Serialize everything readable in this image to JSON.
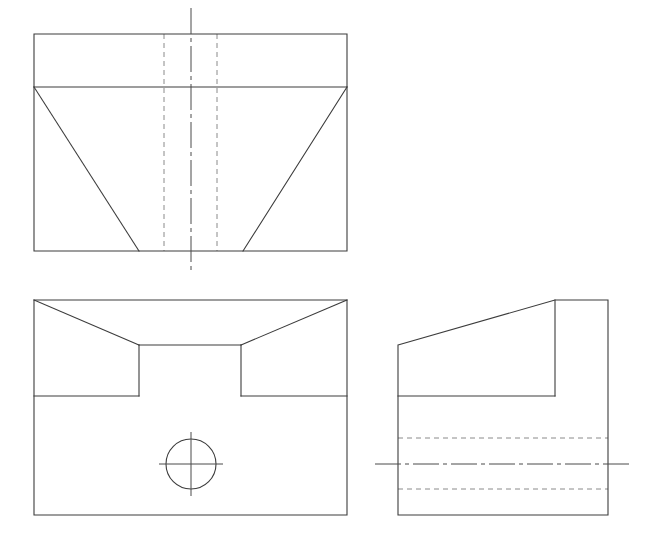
{
  "sheet": {
    "title": "Orthographic Projection - Three View Engineering Drawing",
    "width": 664,
    "height": 556,
    "background_color": "#ffffff",
    "projection": "third-angle",
    "line_styles": {
      "visible_edge_color": "#3c3c3c",
      "visible_edge_width": 1.1,
      "hidden_edge_color": "#8a8a8a",
      "hidden_edge_width": 1,
      "hidden_dash_pattern": "5 4",
      "center_line_color": "#4a4a4a",
      "center_line_width": 1,
      "center_dash_pattern": "26 4 4 4"
    }
  },
  "views": {
    "top": {
      "name": "Top View",
      "outline": "M 34 34 L 347 34 L 347 251 L 34 251 Z",
      "horizontal_divider": "M 34 87 L 347 87",
      "left_taper": "M 34 87 L 139 251",
      "right_taper": "M 347 87 L 243 251",
      "hidden_lines": [
        "M 164 34 L 164 251",
        "M 217 34 L 217 251"
      ],
      "center_line": "M 191 8 L 191 272",
      "bounds": {
        "left": 34,
        "top": 34,
        "right": 347,
        "bottom": 251
      }
    },
    "front": {
      "name": "Front View",
      "outline": "M 34 300 L 347 300 L 347 515 L 34 515 Z",
      "left_chamfer": "M 34 300 L 139 345",
      "right_chamfer": "M 347 300 L 241 345",
      "notch_floor": "M 139 345 L 241 345",
      "notch_left_wall": "M 139 345 L 139 396",
      "notch_right_wall": "M 241 345 L 241 396",
      "ledge_left": "M 34 396 L 139 396",
      "ledge_right": "M 241 396 L 347 396",
      "hole": {
        "center_x": 191,
        "center_y": 464,
        "radius": 25,
        "crosshair_h": "M 159 464 L 223 464",
        "crosshair_v": "M 191 432 L 191 496"
      },
      "bounds": {
        "left": 34,
        "top": 300,
        "right": 347,
        "bottom": 515
      }
    },
    "right_side": {
      "name": "Right Side View",
      "outline": "M 398 345 L 555 300 L 608 300 L 608 515 L 398 515 Z",
      "slope_edge": "M 398 345 L 555 300",
      "step_vertical": "M 555 300 L 555 396",
      "step_ledge": "M 398 396 L 555 396",
      "hidden_lines": [
        "M 398 438 L 608 438",
        "M 398 489 L 608 489"
      ],
      "center_line": "M 375 464 L 633 464",
      "bounds": {
        "left": 398,
        "top": 300,
        "right": 608,
        "bottom": 515
      }
    }
  }
}
